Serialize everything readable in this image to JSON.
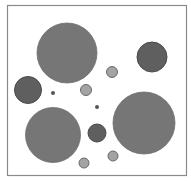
{
  "diagram": {
    "frame": {
      "x": 7,
      "y": 5,
      "width": 179,
      "height": 170,
      "stroke": "#8a8a8a",
      "fill": "#ffffff"
    },
    "colors": {
      "large": "#767676",
      "large_edge": "#6e6e6e",
      "medium_dark": "#5f5f5f",
      "medium_dark_edge": "#4a4a4a",
      "light": "#a3a3a3",
      "light_edge": "#6a6a6a",
      "dot": "#555555"
    },
    "circles": [
      {
        "id": "large-top-left",
        "cx": 67,
        "cy": 53,
        "r": 30,
        "kind": "large"
      },
      {
        "id": "large-bottom-right",
        "cx": 144,
        "cy": 123,
        "r": 31,
        "kind": "large"
      },
      {
        "id": "large-bottom-left",
        "cx": 53,
        "cy": 135,
        "r": 27.5,
        "kind": "large"
      },
      {
        "id": "dark-top-right",
        "cx": 152,
        "cy": 57,
        "r": 15,
        "kind": "medium_dark"
      },
      {
        "id": "dark-left",
        "cx": 28,
        "cy": 90,
        "r": 13.5,
        "kind": "medium_dark"
      },
      {
        "id": "dark-center-bottom",
        "cx": 97,
        "cy": 133,
        "r": 9,
        "kind": "medium_dark"
      },
      {
        "id": "light-upper",
        "cx": 112,
        "cy": 72,
        "r": 5.5,
        "kind": "light"
      },
      {
        "id": "light-middle",
        "cx": 86,
        "cy": 90,
        "r": 5.5,
        "kind": "light"
      },
      {
        "id": "light-lower-right",
        "cx": 113,
        "cy": 156,
        "r": 5,
        "kind": "light"
      },
      {
        "id": "light-lower-left",
        "cx": 84,
        "cy": 163,
        "r": 5,
        "kind": "light"
      },
      {
        "id": "dot-left",
        "cx": 53,
        "cy": 93,
        "r": 2,
        "kind": "dot"
      },
      {
        "id": "dot-center",
        "cx": 97,
        "cy": 107,
        "r": 2,
        "kind": "dot"
      }
    ]
  }
}
